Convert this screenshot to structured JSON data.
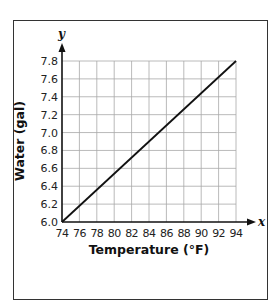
{
  "chart_data": {
    "type": "line",
    "title": "",
    "xlabel": "Temperature (°F)",
    "ylabel": "Water (gal)",
    "x_axis_letter": "x",
    "y_axis_letter": "y",
    "x_ticks": [
      74,
      76,
      78,
      80,
      82,
      84,
      86,
      88,
      90,
      92,
      94
    ],
    "y_ticks": [
      "6.0",
      "6.2",
      "6.4",
      "6.6",
      "6.8",
      "7.0",
      "7.2",
      "7.4",
      "7.6",
      "7.8"
    ],
    "xlim": [
      74,
      94
    ],
    "ylim": [
      6.0,
      7.8
    ],
    "grid": true,
    "legend": null,
    "series": [
      {
        "name": "Water vs Temperature",
        "x": [
          74,
          94
        ],
        "y": [
          6.0,
          7.8
        ],
        "color": "#111111"
      }
    ]
  }
}
